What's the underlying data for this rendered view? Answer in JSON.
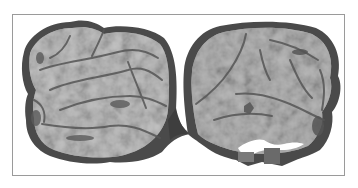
{
  "image": {
    "description": "Grayscale photograph of a bisected specimen showing two rounded lobes with fissured, marbled cut surface",
    "colors": {
      "background": "#ffffff",
      "frame": "#9a9a9a",
      "rim": "#4a4a4a",
      "surface_light": "#c4c4c4",
      "surface_mid": "#a8a8a8",
      "fissure": "#555555"
    },
    "lobes": [
      "left",
      "right"
    ]
  }
}
